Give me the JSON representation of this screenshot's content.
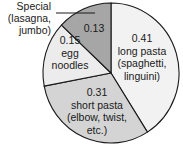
{
  "chart_data": {
    "type": "pie",
    "title": "",
    "start": "top",
    "direction": "clockwise",
    "slices": [
      {
        "value": 0.41,
        "value_label": "0.41",
        "label_lines": [
          "long pasta",
          "(spaghetti,",
          "linguini)"
        ],
        "color": "#f2f2f2"
      },
      {
        "value": 0.31,
        "value_label": "0.31",
        "label_lines": [
          "short pasta",
          "(elbow, twist,",
          "etc.)"
        ],
        "color": "#d4d4d4"
      },
      {
        "value": 0.15,
        "value_label": "0.15",
        "label_lines": [
          "egg",
          "noodles"
        ],
        "color": "#ececec"
      },
      {
        "value": 0.13,
        "value_label": "0.13",
        "label_lines": [],
        "color": "#a6a6a6"
      }
    ],
    "callout": {
      "slice_index": 3,
      "label_lines": [
        "Special",
        "(lasagna,",
        "jumbo)"
      ]
    },
    "outline_color": "#1a1a1a"
  }
}
